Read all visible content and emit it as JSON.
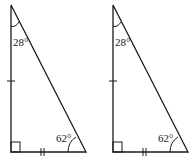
{
  "diagram": {
    "stroke_color": "#1a1a1a",
    "triangles": [
      {
        "id": "left",
        "top_angle": "28°",
        "bottom_right_angle": "62°",
        "right_angle_at": "bottom-left",
        "vertical_leg_ticks": 1,
        "horizontal_leg_ticks": 2
      },
      {
        "id": "right",
        "top_angle": "28°",
        "bottom_right_angle": "62°",
        "right_angle_at": "bottom-left",
        "vertical_leg_ticks": 1,
        "horizontal_leg_ticks": 2
      }
    ]
  }
}
